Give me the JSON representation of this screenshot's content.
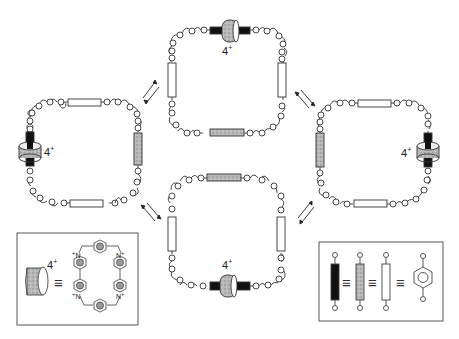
{
  "figure": {
    "type": "molecular-shuttle-equilibrium-diagram",
    "charge_label": "4",
    "charge_sign": "+",
    "equivalence_symbol": "≡",
    "colors": {
      "line": "#333333",
      "background": "#ffffff",
      "station_black": "#111111",
      "station_gray": "#a8a8a8",
      "station_white": "#ffffff",
      "ring_gray": "#b5b5b5"
    }
  },
  "rings": [
    {
      "id": "left",
      "shuttle_position": "left-side",
      "gray_station": "right-side"
    },
    {
      "id": "top",
      "shuttle_position": "top-side",
      "gray_station": "bottom-side"
    },
    {
      "id": "right",
      "shuttle_position": "right-side",
      "gray_station": "left-side"
    },
    {
      "id": "bottom",
      "shuttle_position": "bottom-side",
      "gray_station": "top-side"
    }
  ],
  "equilibria": [
    {
      "between": [
        "left",
        "top"
      ]
    },
    {
      "between": [
        "left",
        "bottom"
      ]
    },
    {
      "between": [
        "top",
        "right"
      ]
    },
    {
      "between": [
        "bottom",
        "right"
      ]
    }
  ],
  "legend_left": {
    "title": "tetracationic cyclophane",
    "atoms": [
      "N",
      "N",
      "N",
      "N"
    ],
    "atom_charge": "+"
  },
  "legend_right": {
    "title": "hydroquinone station",
    "oxygen": "O"
  }
}
